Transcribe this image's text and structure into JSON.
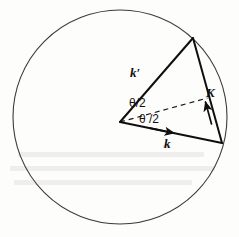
{
  "figure": {
    "kind": "scattering-vector-diagram",
    "width": 239,
    "height": 237,
    "background_color": "#fdfdfc"
  },
  "colors": {
    "circle_stroke": "#3b3a37",
    "vector_stroke": "#100f0d",
    "dashed_stroke": "#1a1917",
    "label_text": "#100f0d",
    "angle_text": "#131210",
    "bleed_through": "#cfcdc6"
  },
  "circle": {
    "name": "ewald-sphere",
    "center_x": 120,
    "center_y": 117,
    "radius": 107,
    "stroke_width": 1.1
  },
  "points": {
    "origin": {
      "x": 120,
      "y": 122,
      "role": "sphere-centre / common vector tail"
    },
    "k_prime_tip": {
      "x": 193,
      "y": 38,
      "role": "tip of scattered wavevector on sphere"
    },
    "k_tip": {
      "x": 222,
      "y": 143,
      "role": "tip of incident wavevector on sphere"
    },
    "bisector_end": {
      "x": 207.5,
      "y": 98,
      "role": "dashed bisector endpoint at midpoint of K"
    }
  },
  "vectors": [
    {
      "id": "k-prime",
      "label": "k′",
      "from": "origin",
      "to": "k_prime_tip",
      "arrowhead": false,
      "stroke_width": 2.0,
      "meaning": "scattered wavevector"
    },
    {
      "id": "k",
      "label": "k",
      "from": "origin",
      "to": "k_tip",
      "arrowhead": true,
      "arrow_at_x": 172,
      "arrow_at_y": 131,
      "stroke_width": 2.0,
      "meaning": "incident wavevector"
    },
    {
      "id": "K",
      "label": "K",
      "from": "k_tip",
      "to": "k_prime_tip",
      "arrowhead": true,
      "arrow_at_x": 206,
      "arrow_at_y": 107,
      "stroke_width": 2.0,
      "meaning": "scattering vector K = k' - k"
    }
  ],
  "dashed_bisector": {
    "id": "theta-bisector",
    "from": "origin",
    "to": "bisector_end",
    "dash_pattern": "5,4",
    "stroke_width": 1.2
  },
  "labels": {
    "k_prime": "k′",
    "k": "k",
    "K": "K",
    "theta_upper": "θ/2",
    "theta_lower": "θ /2"
  },
  "angles": {
    "upper_half": "θ/2",
    "lower_half": "θ /2",
    "total": "θ",
    "note": "scattering angle theta between k and k' is bisected"
  }
}
